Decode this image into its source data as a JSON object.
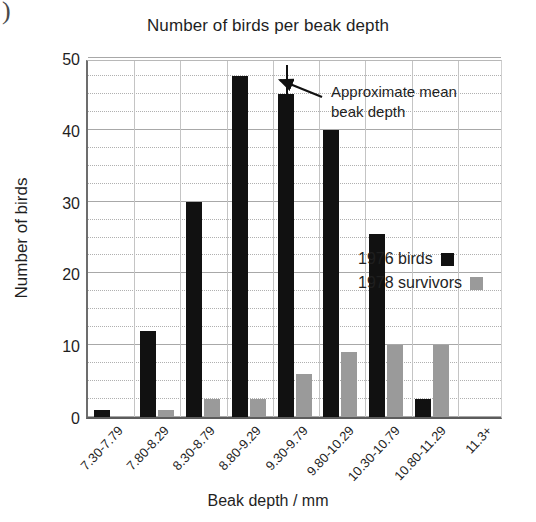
{
  "artifact": {
    "mark": ")"
  },
  "chart_data": {
    "type": "bar",
    "title": "Number of birds per beak depth",
    "xlabel": "Beak depth / mm",
    "ylabel": "Number of birds",
    "categories": [
      "7.30-7.79",
      "7.80-8.29",
      "8.30-8.79",
      "8.80-9.29",
      "9.30-9.79",
      "9.80-10.29",
      "10.30-10.79",
      "10.80-11.29",
      "11.3+"
    ],
    "series": [
      {
        "name": "1976 birds",
        "color": "#111111",
        "values": [
          1,
          12,
          30,
          47.5,
          45,
          40,
          25.5,
          2.5,
          0
        ]
      },
      {
        "name": "1978 survivors",
        "color": "#9a9a9a",
        "values": [
          0,
          1,
          2.5,
          2.5,
          6,
          9,
          10,
          10,
          0
        ]
      }
    ],
    "ylim": [
      0,
      50
    ],
    "yticks": [
      0,
      10,
      20,
      30,
      40,
      50
    ],
    "y_minor_step": 2.5,
    "grid": true,
    "legend_position": "inside-right",
    "annotations": [
      {
        "text_line1": "Approximate mean",
        "text_line2": "beak depth",
        "target_category": "9.30-9.79",
        "marker_value": 49
      }
    ]
  },
  "legend": {
    "items": [
      {
        "label": "1976 birds",
        "color": "#111111"
      },
      {
        "label": "1978 survivors",
        "color": "#9a9a9a"
      }
    ]
  }
}
